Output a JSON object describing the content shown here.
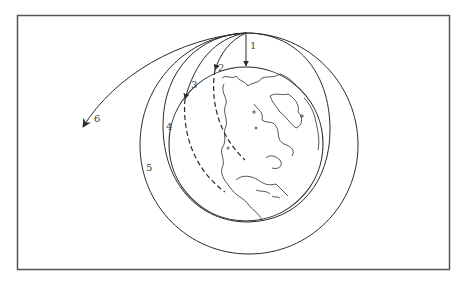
{
  "figure": {
    "frame_color": "#555555",
    "line_color": "#2a2a2a",
    "labels": [
      {
        "id": "1",
        "text": "1",
        "x": 250,
        "y": 49
      },
      {
        "id": "2",
        "text": "2",
        "x": 218,
        "y": 71
      },
      {
        "id": "3",
        "text": "3",
        "x": 191,
        "y": 88
      },
      {
        "id": "4",
        "text": "4",
        "x": 166,
        "y": 130
      },
      {
        "id": "5",
        "text": "5",
        "x": 146,
        "y": 171
      },
      {
        "id": "6",
        "text": "6",
        "x": 94,
        "y": 122
      }
    ],
    "launch_point": {
      "x": 246,
      "y": 33
    },
    "earth": {
      "cx": 246,
      "cy": 144,
      "r": 77
    },
    "trajectories": [
      {
        "id": "1",
        "kind": "falls straight down"
      },
      {
        "id": "2",
        "kind": "short arc, continues dashed inside Earth"
      },
      {
        "id": "3",
        "kind": "longer arc, continues dashed inside Earth"
      },
      {
        "id": "4",
        "kind": "circular orbit"
      },
      {
        "id": "5",
        "kind": "elliptical orbit"
      },
      {
        "id": "6",
        "kind": "escape trajectory"
      }
    ]
  }
}
